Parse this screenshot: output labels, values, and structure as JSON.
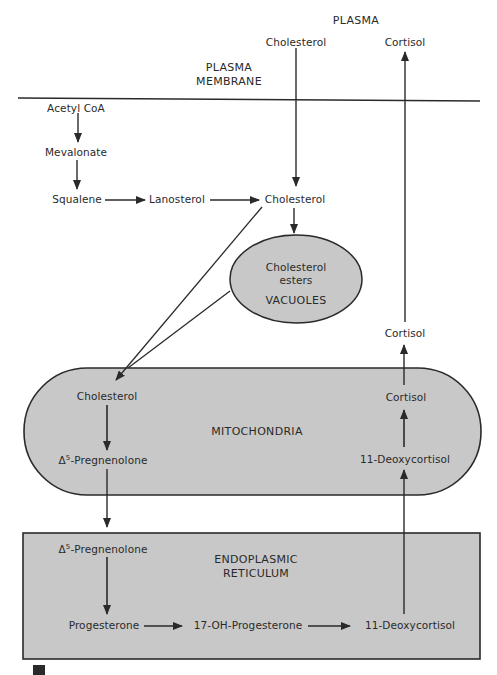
{
  "regions": {
    "plasma": "PLASMA",
    "plasma_membrane_1": "PLASMA",
    "plasma_membrane_2": "MEMBRANE",
    "vacuoles": "VACUOLES",
    "mitochondria": "MITOCHONDRIA",
    "er_1": "ENDOPLASMIC",
    "er_2": "RETICULUM"
  },
  "nodes": {
    "plasma_cholesterol": "Cholesterol",
    "plasma_cortisol": "Cortisol",
    "acetyl_coa": "Acetyl CoA",
    "mevalonate": "Mevalonate",
    "squalene": "Squalene",
    "lanosterol": "Lanosterol",
    "cytosol_cholesterol": "Cholesterol",
    "cholesterol_esters_1": "Cholesterol",
    "cholesterol_esters_2": "esters",
    "cytosol_cortisol": "Cortisol",
    "mito_cholesterol": "Cholesterol",
    "mito_pregnenolone_delta": "Δ",
    "mito_pregnenolone_sup": "5",
    "mito_pregnenolone_name": "-Pregnenolone",
    "mito_cortisol": "Cortisol",
    "mito_deoxycortisol": "11-Deoxycortisol",
    "er_pregnenolone_delta": "Δ",
    "er_pregnenolone_sup": "5",
    "er_pregnenolone_name": "-Pregnenolone",
    "progesterone": "Progesterone",
    "oh_progesterone": "17-OH-Progesterone",
    "er_deoxycortisol": "11-Deoxycortisol"
  },
  "colors": {
    "organelle_fill": "#c8c8c8",
    "stroke": "#2a2a2a",
    "background": "#ffffff"
  }
}
